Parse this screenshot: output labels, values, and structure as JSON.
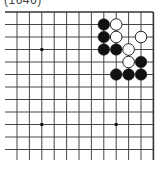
{
  "caption": "(1646)",
  "board": {
    "cols": 12,
    "rows": 13,
    "origin_x": 17,
    "origin_y": 12,
    "spacing_x": 12.4,
    "spacing_y": 12.5,
    "edges": {
      "top": true,
      "right": true,
      "left": false,
      "bottom": false
    },
    "star_points": [
      [
        2,
        3
      ],
      [
        2,
        9
      ],
      [
        8,
        9
      ]
    ],
    "stones": [
      {
        "color": "black",
        "col": 7,
        "row": 1
      },
      {
        "color": "white",
        "col": 8,
        "row": 1
      },
      {
        "color": "black",
        "col": 7,
        "row": 2
      },
      {
        "color": "white",
        "col": 8,
        "row": 2
      },
      {
        "color": "white",
        "col": 10,
        "row": 2
      },
      {
        "color": "black",
        "col": 7,
        "row": 3
      },
      {
        "color": "black",
        "col": 8,
        "row": 3
      },
      {
        "color": "white",
        "col": 9,
        "row": 3
      },
      {
        "color": "white",
        "col": 9,
        "row": 4
      },
      {
        "color": "black",
        "col": 10,
        "row": 4
      },
      {
        "color": "black",
        "col": 8,
        "row": 5
      },
      {
        "color": "black",
        "col": 9,
        "row": 5
      },
      {
        "color": "black",
        "col": 10,
        "row": 5
      }
    ],
    "colors": {
      "line": "#333333",
      "black": "#111111",
      "white": "#ffffff"
    }
  }
}
